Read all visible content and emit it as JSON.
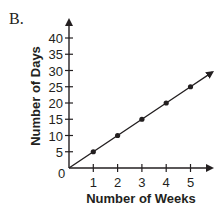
{
  "panel_label": "B.",
  "chart_data": {
    "type": "line",
    "title": "",
    "xlabel": "Number of Weeks",
    "ylabel": "Number of Days",
    "x": [
      1,
      2,
      3,
      4,
      5
    ],
    "values": [
      5,
      10,
      15,
      20,
      25
    ],
    "series": [
      {
        "name": "Days",
        "x": [
          0,
          1,
          2,
          3,
          4,
          5
        ],
        "values": [
          0,
          5,
          10,
          15,
          20,
          25
        ]
      }
    ],
    "x_ticks": [
      "1",
      "2",
      "3",
      "4",
      "5"
    ],
    "y_ticks": [
      "5",
      "10",
      "15",
      "20",
      "25",
      "30",
      "35",
      "40"
    ],
    "origin_label": "0",
    "xlim": [
      0,
      6
    ],
    "ylim": [
      0,
      45
    ],
    "grid": false,
    "legend": "none"
  }
}
